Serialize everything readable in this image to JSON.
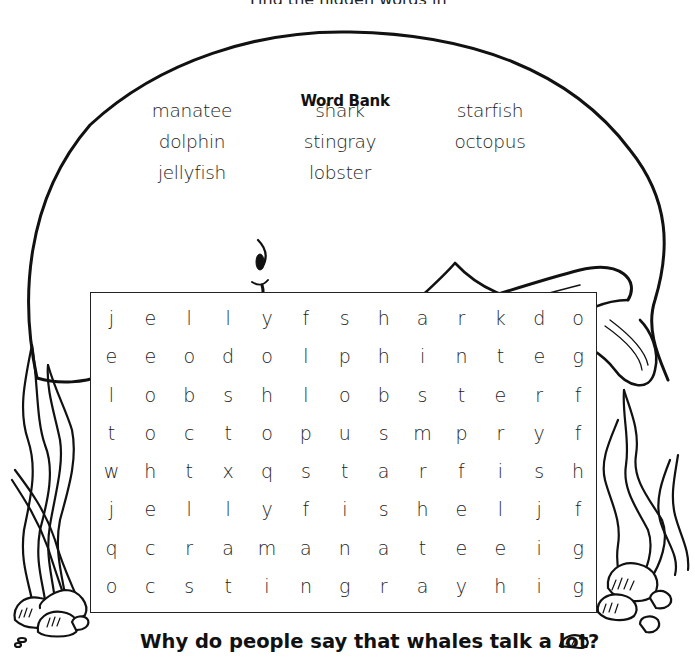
{
  "page": {
    "top_cut_text": "Find the hidden words in the puzzle.",
    "word_bank": {
      "title": "Word Bank",
      "columns": [
        [
          "manatee",
          "dolphin",
          "jellyfish"
        ],
        [
          "shark",
          "stingray",
          "lobster"
        ],
        [
          "starfish",
          "octopus"
        ]
      ]
    },
    "puzzle": {
      "rows": [
        [
          "j",
          "e",
          "l",
          "l",
          "y",
          "f",
          "s",
          "h",
          "a",
          "r",
          "k",
          "d",
          "o"
        ],
        [
          "e",
          "e",
          "o",
          "d",
          "o",
          "l",
          "p",
          "h",
          "i",
          "n",
          "t",
          "e",
          "g"
        ],
        [
          "l",
          "o",
          "b",
          "s",
          "h",
          "l",
          "o",
          "b",
          "s",
          "t",
          "e",
          "r",
          "f"
        ],
        [
          "t",
          "o",
          "c",
          "t",
          "o",
          "p",
          "u",
          "s",
          "m",
          "p",
          "r",
          "y",
          "f"
        ],
        [
          "w",
          "h",
          "t",
          "x",
          "q",
          "s",
          "t",
          "a",
          "r",
          "f",
          "i",
          "s",
          "h"
        ],
        [
          "j",
          "e",
          "l",
          "l",
          "y",
          "f",
          "i",
          "s",
          "h",
          "e",
          "l",
          "j",
          "f"
        ],
        [
          "q",
          "c",
          "r",
          "a",
          "m",
          "a",
          "n",
          "a",
          "t",
          "e",
          "e",
          "i",
          "g"
        ],
        [
          "o",
          "c",
          "s",
          "t",
          "i",
          "n",
          "g",
          "r",
          "a",
          "y",
          "h",
          "i",
          "g"
        ]
      ]
    },
    "question": "Why do people say that whales talk a lot?",
    "illustrations": [
      "whale-illustration",
      "seaweed-left",
      "seaweed-right",
      "rocks"
    ]
  }
}
